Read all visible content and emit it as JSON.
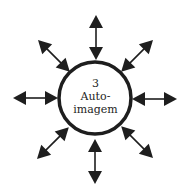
{
  "diagram": {
    "center_node": {
      "number": "3",
      "label_line1": "Auto-",
      "label_line2": "imagem"
    },
    "arrows": [
      {
        "direction": "up",
        "type": "bidirectional"
      },
      {
        "direction": "up-right",
        "type": "bidirectional"
      },
      {
        "direction": "right",
        "type": "bidirectional"
      },
      {
        "direction": "down-right",
        "type": "bidirectional"
      },
      {
        "direction": "down",
        "type": "bidirectional"
      },
      {
        "direction": "down-left",
        "type": "bidirectional"
      },
      {
        "direction": "left",
        "type": "bidirectional"
      },
      {
        "direction": "up-left",
        "type": "bidirectional"
      }
    ],
    "colors": {
      "stroke": "#1e1e1e",
      "background": "#ffffff"
    }
  }
}
